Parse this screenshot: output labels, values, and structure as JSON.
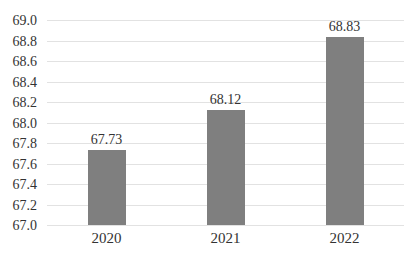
{
  "chart_data": {
    "type": "bar",
    "title": "",
    "xlabel": "",
    "ylabel": "",
    "categories": [
      "2020",
      "2021",
      "2022"
    ],
    "values": [
      67.73,
      68.12,
      68.83
    ],
    "value_labels": [
      "67.73",
      "68.12",
      "68.83"
    ],
    "ylim": [
      67.0,
      69.0
    ],
    "ytick_step": 0.2,
    "yticks": [
      "69.0",
      "68.8",
      "68.6",
      "68.4",
      "68.2",
      "68.0",
      "67.8",
      "67.6",
      "67.4",
      "67.2",
      "67.0"
    ],
    "grid": true,
    "legend": "none",
    "colors": {
      "bar": "#7f7f7f",
      "gridline": "#e2e2e2",
      "text": "#333333",
      "background": "#ffffff"
    },
    "layout": {
      "bar_width_px": 38,
      "plot_left_px": 47,
      "plot_top_px": 20,
      "plot_width_px": 357,
      "plot_height_px": 205
    }
  }
}
